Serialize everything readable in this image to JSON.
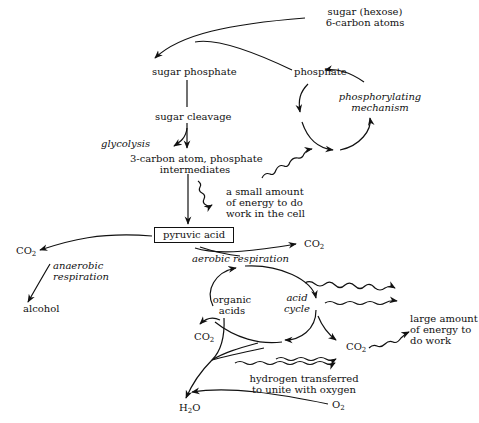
{
  "diagram": {
    "nodes": {
      "sugar_hexose": {
        "line1": "sugar (hexose)",
        "line2": "6-carbon atoms"
      },
      "sugar_phosphate": "sugar phosphate",
      "phosphate": "phosphate",
      "phosphorylating": {
        "line1": "phosphorylating",
        "line2": "mechanism"
      },
      "sugar_cleavage": "sugar cleavage",
      "glycolysis": "glycolysis",
      "three_carbon": {
        "line1": "3-carbon atom, phosphate",
        "line2": "intermediates"
      },
      "small_energy": {
        "line1": "a small amount",
        "line2": "of energy to do",
        "line3": "work in the cell"
      },
      "pyruvic_acid": "pyruvic acid",
      "co2_left": {
        "base": "CO",
        "sub": "2"
      },
      "co2_right": {
        "base": "CO",
        "sub": "2"
      },
      "anaerobic": {
        "line1": "anaerobic",
        "line2": "respiration"
      },
      "alcohol": "alcohol",
      "aerobic": "aerobic respiration",
      "organic_acids": {
        "line1": "organic",
        "line2": "acids"
      },
      "acid_cycle": {
        "line1": "acid",
        "line2": "cycle"
      },
      "large_energy": {
        "line1": "large amount",
        "line2": "of energy to",
        "line3": "do work"
      },
      "co2_cycle_left": {
        "base": "CO",
        "sub": "2"
      },
      "co2_cycle_right": {
        "base": "CO",
        "sub": "2"
      },
      "hydrogen": {
        "line1": "hydrogen transferred",
        "line2": "to unite with oxygen"
      },
      "h2o": {
        "pre": "H",
        "sub": "2",
        "post": "O"
      },
      "o2": {
        "base": "O",
        "sub": "2"
      }
    }
  }
}
